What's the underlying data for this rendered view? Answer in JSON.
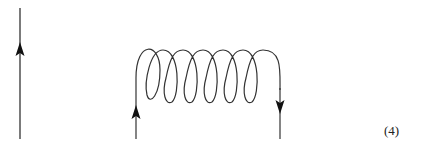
{
  "diagram": {
    "elements": [
      {
        "type": "straight-line",
        "direction": "up",
        "arrow": "up"
      },
      {
        "type": "coil",
        "loops": 7,
        "left_leg_arrow": "up",
        "right_leg_arrow": "down"
      }
    ],
    "stroke_color": "#333333",
    "equation_number": "(4)"
  }
}
